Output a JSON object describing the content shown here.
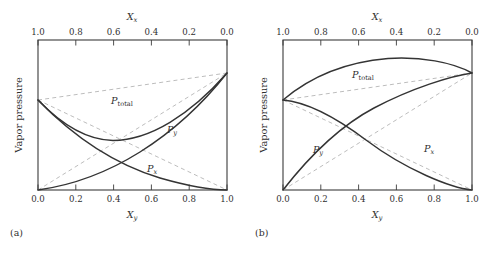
{
  "figure": {
    "panels": [
      {
        "caption": "(a)",
        "deviation": "negative",
        "axes": {
          "ylabel": "Vapor pressure",
          "top_axis_name": "X",
          "top_axis_sub": "x",
          "bottom_axis_name": "X",
          "bottom_axis_sub": "y",
          "top_ticks": [
            "1.0",
            "0.8",
            "0.6",
            "0.4",
            "0.2",
            "0.0"
          ],
          "bottom_ticks": [
            "0.0",
            "0.2",
            "0.4",
            "0.6",
            "0.8",
            "1.0"
          ]
        },
        "curve_labels": {
          "total": "P",
          "total_sub": "total",
          "py": "P",
          "py_sub": "y",
          "px": "P",
          "px_sub": "x"
        }
      },
      {
        "caption": "(b)",
        "deviation": "positive",
        "axes": {
          "ylabel": "Vapor pressure",
          "top_axis_name": "X",
          "top_axis_sub": "x",
          "bottom_axis_name": "X",
          "bottom_axis_sub": "y",
          "top_ticks": [
            "1.0",
            "0.8",
            "0.6",
            "0.4",
            "0.2",
            "0.0"
          ],
          "bottom_ticks": [
            "0.0",
            "0.2",
            "0.4",
            "0.6",
            "0.8",
            "1.0"
          ]
        },
        "curve_labels": {
          "total": "P",
          "total_sub": "total",
          "py": "P",
          "py_sub": "y",
          "px": "P",
          "px_sub": "x"
        }
      }
    ]
  },
  "chart_data": [
    {
      "type": "line",
      "title": "(a) Negative deviation from Raoult's law",
      "xlabel": "X_y",
      "ylabel": "Vapor pressure",
      "xlim": [
        0,
        1
      ],
      "ylim": [
        0,
        1
      ],
      "grid": false,
      "legend": "inline-annotations",
      "x": [
        0.0,
        0.1,
        0.2,
        0.3,
        0.4,
        0.5,
        0.6,
        0.7,
        0.8,
        0.9,
        1.0
      ],
      "series": [
        {
          "name": "P_x",
          "style": "solid",
          "description": "Partial pressure of component x; falls from left intercept to zero at right, curving below the ideal straight line",
          "values": [
            0.6,
            0.47,
            0.36,
            0.275,
            0.205,
            0.15,
            0.105,
            0.068,
            0.04,
            0.018,
            0.0
          ]
        },
        {
          "name": "P_y",
          "style": "solid",
          "description": "Partial pressure of component y; rises from zero at left to the right intercept, curving below the ideal straight line",
          "values": [
            0.0,
            0.022,
            0.05,
            0.085,
            0.128,
            0.18,
            0.245,
            0.325,
            0.43,
            0.57,
            0.78
          ]
        },
        {
          "name": "P_total",
          "style": "solid",
          "description": "Total vapor pressure; sags below the ideal line showing negative deviation, with a shallow minimum near X_y = 0.3",
          "values": [
            0.6,
            0.492,
            0.41,
            0.36,
            0.333,
            0.33,
            0.35,
            0.393,
            0.47,
            0.588,
            0.78
          ]
        },
        {
          "name": "P_x ideal (Raoult)",
          "style": "dashed",
          "description": "Ideal Raoult's law line for component x, straight from 0.6 to 0",
          "values": [
            0.6,
            0.54,
            0.48,
            0.42,
            0.36,
            0.3,
            0.24,
            0.18,
            0.12,
            0.06,
            0.0
          ]
        },
        {
          "name": "P_y ideal (Raoult)",
          "style": "dashed",
          "description": "Ideal Raoult's law line for component y, straight from 0 to 0.78",
          "values": [
            0.0,
            0.078,
            0.156,
            0.234,
            0.312,
            0.39,
            0.468,
            0.546,
            0.624,
            0.702,
            0.78
          ]
        },
        {
          "name": "P_total ideal (Raoult)",
          "style": "dashed",
          "description": "Ideal total pressure, straight line from 0.6 to 0.78",
          "values": [
            0.6,
            0.618,
            0.636,
            0.654,
            0.672,
            0.69,
            0.708,
            0.726,
            0.744,
            0.762,
            0.78
          ]
        }
      ]
    },
    {
      "type": "line",
      "title": "(b) Positive deviation from Raoult's law",
      "xlabel": "X_y",
      "ylabel": "Vapor pressure",
      "xlim": [
        0,
        1
      ],
      "ylim": [
        0,
        1
      ],
      "grid": false,
      "legend": "inline-annotations",
      "x": [
        0.0,
        0.1,
        0.2,
        0.3,
        0.4,
        0.5,
        0.6,
        0.7,
        0.8,
        0.9,
        1.0
      ],
      "series": [
        {
          "name": "P_x",
          "style": "solid",
          "description": "Partial pressure of component x; falls from left intercept to zero at right, curving above the ideal straight line",
          "values": [
            0.6,
            0.585,
            0.555,
            0.51,
            0.45,
            0.385,
            0.315,
            0.245,
            0.172,
            0.095,
            0.0
          ]
        },
        {
          "name": "P_y",
          "style": "solid",
          "description": "Partial pressure of component y; rises from zero at left to the right intercept, curving above the ideal straight line",
          "values": [
            0.0,
            0.105,
            0.205,
            0.3,
            0.39,
            0.475,
            0.555,
            0.63,
            0.695,
            0.745,
            0.78
          ]
        },
        {
          "name": "P_total",
          "style": "solid",
          "description": "Total vapor pressure; arcs above the ideal line showing positive deviation, with a broad maximum near X_y = 0.65",
          "values": [
            0.6,
            0.69,
            0.76,
            0.81,
            0.84,
            0.86,
            0.87,
            0.875,
            0.867,
            0.84,
            0.78
          ]
        },
        {
          "name": "P_x ideal (Raoult)",
          "style": "dashed",
          "description": "Ideal Raoult's law line for component x, straight from 0.6 to 0",
          "values": [
            0.6,
            0.54,
            0.48,
            0.42,
            0.36,
            0.3,
            0.24,
            0.18,
            0.12,
            0.06,
            0.0
          ]
        },
        {
          "name": "P_y ideal (Raoult)",
          "style": "dashed",
          "description": "Ideal Raoult's law line for component y, straight from 0 to 0.78",
          "values": [
            0.0,
            0.078,
            0.156,
            0.234,
            0.312,
            0.39,
            0.468,
            0.546,
            0.624,
            0.702,
            0.78
          ]
        },
        {
          "name": "P_total ideal (Raoult)",
          "style": "dashed",
          "description": "Ideal total pressure, straight line from 0.6 to 0.78",
          "values": [
            0.6,
            0.618,
            0.636,
            0.654,
            0.672,
            0.69,
            0.708,
            0.726,
            0.744,
            0.762,
            0.78
          ]
        }
      ]
    }
  ]
}
